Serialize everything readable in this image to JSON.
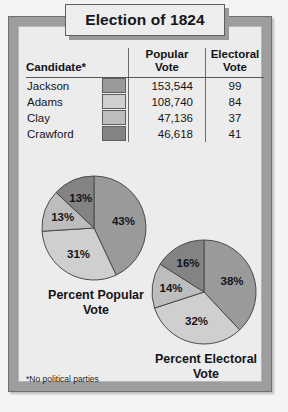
{
  "title": "Election of 1824",
  "footnote": "*No political parties",
  "table": {
    "headers": {
      "candidate": "Candidate*",
      "popular": "Popular\nVote",
      "popular_line1": "Popular",
      "popular_line2": "Vote",
      "electoral_line1": "Electoral",
      "electoral_line2": "Vote"
    },
    "rows": [
      {
        "candidate": "Jackson",
        "popular_vote": "153,544",
        "electoral_vote": "99",
        "color": "#9a9a9a"
      },
      {
        "candidate": "Adams",
        "popular_vote": "108,740",
        "electoral_vote": "84",
        "color": "#cfcfcf"
      },
      {
        "candidate": "Clay",
        "popular_vote": "47,136",
        "electoral_vote": "37",
        "color": "#bdbdbd"
      },
      {
        "candidate": "Crawford",
        "popular_vote": "46,618",
        "electoral_vote": "41",
        "color": "#838383"
      }
    ]
  },
  "captions": {
    "popular": "Percent Popular\nVote",
    "electoral": "Percent Electoral\nVote"
  },
  "chart_data": [
    {
      "type": "pie",
      "title": "Percent Popular Vote",
      "categories": [
        "Jackson",
        "Adams",
        "Clay",
        "Crawford"
      ],
      "values": [
        43,
        31,
        13,
        13
      ],
      "labels": [
        "43%",
        "31%",
        "13%",
        "13%"
      ],
      "colors": [
        "#9a9a9a",
        "#cfcfcf",
        "#bdbdbd",
        "#838383"
      ],
      "start_angle_deg": 0,
      "direction": "clockwise",
      "legend": "table-swatches"
    },
    {
      "type": "pie",
      "title": "Percent Electoral Vote",
      "categories": [
        "Jackson",
        "Adams",
        "Clay",
        "Crawford"
      ],
      "values": [
        38,
        32,
        14,
        16
      ],
      "labels": [
        "38%",
        "32%",
        "14%",
        "16%"
      ],
      "colors": [
        "#9a9a9a",
        "#cfcfcf",
        "#bdbdbd",
        "#838383"
      ],
      "start_angle_deg": 0,
      "direction": "clockwise",
      "legend": "table-swatches"
    }
  ]
}
